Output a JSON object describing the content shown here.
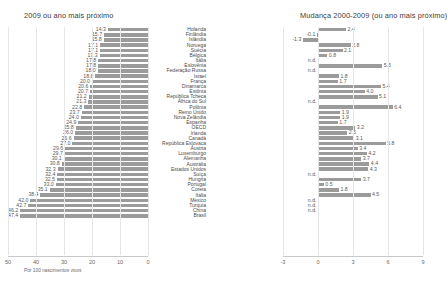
{
  "panels": {
    "left": {
      "title": "2009 ou ano mais próximo",
      "axis_note": "Por 100 nascimentos vivos"
    },
    "right": {
      "title": "Mudança 2000-2009 (ou ano mais próximo)"
    }
  },
  "chart_data": [
    {
      "type": "bar",
      "title": "2009 ou ano mais próximo",
      "orientation": "horizontal",
      "direction": "right-to-left",
      "xlabel": "Por 100 nascimentos vivos",
      "ylabel": "",
      "xlim": [
        50,
        0
      ],
      "ticks": [
        "50",
        "40",
        "30",
        "20",
        "10",
        "0"
      ],
      "grid": true,
      "categories": [
        "Holanda",
        "Finlândia",
        "Islândia",
        "Noruega",
        "Suécia",
        "Bélgica",
        "Itália",
        "Eslovênia",
        "Federação Russa",
        "Israel",
        "França",
        "Dinamarca",
        "Estônia",
        "República Tcheca",
        "África do Sul",
        "Polônia",
        "Reino Unido",
        "Nova Zelândia",
        "Espanha",
        "OECD",
        "Irlanda",
        "Canadá",
        "República Eslovaca",
        "Áustria",
        "Luxemburgo",
        "Alemanha",
        "Austrália",
        "Estados Unidos",
        "Suíça",
        "Hungria",
        "Portugal",
        "Coreia",
        "Itália",
        "México",
        "Turquia",
        "China",
        "Brasil"
      ],
      "values": [
        14.3,
        15.7,
        15.8,
        17.1,
        17.1,
        17.3,
        17.8,
        17.8,
        18.0,
        18.8,
        20.0,
        20.6,
        20.7,
        21.2,
        21.3,
        22.8,
        23.7,
        24.0,
        24.9,
        25.8,
        26.0,
        26.6,
        27.0,
        29.6,
        29.7,
        30.1,
        30.8,
        32.3,
        32.4,
        32.5,
        33.0,
        35.1,
        38.4,
        42.0,
        42.7,
        46.2,
        47.4
      ]
    },
    {
      "type": "bar",
      "title": "Mudança 2000-2009 (ou ano mais próximo)",
      "orientation": "horizontal",
      "direction": "left-to-right",
      "xlabel": "",
      "ylabel": "",
      "xlim": [
        -3,
        9
      ],
      "ticks": [
        "-3",
        "0",
        "3",
        "6",
        "9"
      ],
      "grid": true,
      "categories": [
        "Holanda",
        "Finlândia",
        "Islândia",
        "Noruega",
        "Suécia",
        "Bélgica",
        "Itália",
        "Eslovênia",
        "Federação Russa",
        "Israel",
        "França",
        "Dinamarca",
        "Estônia",
        "República Tcheca",
        "África do Sul",
        "Polônia",
        "Reino Unido",
        "Nova Zelândia",
        "Espanha",
        "OECD",
        "Irlanda",
        "Canadá",
        "República Eslovaca",
        "Áustria",
        "Luxemburgo",
        "Alemanha",
        "Austrália",
        "Estados Unidos",
        "Suíça",
        "Hungria",
        "Portugal",
        "Coreia",
        "Itália",
        "México",
        "Turquia",
        "China",
        "Brasil"
      ],
      "values": [
        2.4,
        -0.1,
        -1.3,
        2.8,
        2.1,
        0.8,
        null,
        5.5,
        null,
        1.8,
        1.7,
        5.4,
        4.0,
        5.1,
        null,
        6.4,
        1.9,
        1.9,
        1.7,
        3.2,
        2.5,
        3.1,
        5.8,
        3.4,
        4.2,
        3.7,
        4.4,
        4.3,
        null,
        3.7,
        0.5,
        1.8,
        4.5,
        null,
        null,
        null,
        null
      ],
      "missing_label": "n.d."
    }
  ],
  "rows": [
    {
      "country": "Holanda",
      "left": "14.3",
      "right": "2.4"
    },
    {
      "country": "Finlândia",
      "left": "15.7",
      "right": "-0.1"
    },
    {
      "country": "Islândia",
      "left": "15.8",
      "right": "-1.3"
    },
    {
      "country": "Noruega",
      "left": "17.1",
      "right": "2.8"
    },
    {
      "country": "Suécia",
      "left": "17.1",
      "right": "2.1"
    },
    {
      "country": "Bélgica",
      "left": "17.3",
      "right": "0.8"
    },
    {
      "country": "Itália",
      "left": "17.8",
      "right": "n.d."
    },
    {
      "country": "Eslovênia",
      "left": "17.8",
      "right": "5.5"
    },
    {
      "country": "Federação Russa",
      "left": "18.0",
      "right": "n.d."
    },
    {
      "country": "Israel",
      "left": "18.8",
      "right": "1.8"
    },
    {
      "country": "França",
      "left": "20.0",
      "right": "1.7"
    },
    {
      "country": "Dinamarca",
      "left": "20.6",
      "right": "5.4"
    },
    {
      "country": "Estônia",
      "left": "20.7",
      "right": "4.0"
    },
    {
      "country": "República Tcheca",
      "left": "21.2",
      "right": "5.1"
    },
    {
      "country": "África do Sul",
      "left": "21.3",
      "right": "n.d."
    },
    {
      "country": "Polônia",
      "left": "22.8",
      "right": "6.4"
    },
    {
      "country": "Reino Unido",
      "left": "23.7",
      "right": "1.9"
    },
    {
      "country": "Nova Zelândia",
      "left": "24.0",
      "right": "1.9"
    },
    {
      "country": "Espanha",
      "left": "24.9",
      "right": "1.7"
    },
    {
      "country": "OECD",
      "left": "25.8",
      "right": "3.2"
    },
    {
      "country": "Irlanda",
      "left": "26.0",
      "right": "2.5"
    },
    {
      "country": "Canadá",
      "left": "26.6",
      "right": "3.1"
    },
    {
      "country": "República Eslovaca",
      "left": "27.0",
      "right": "5.8"
    },
    {
      "country": "Áustria",
      "left": "29.6",
      "right": "3.4"
    },
    {
      "country": "Luxemburgo",
      "left": "29.7",
      "right": "4.2"
    },
    {
      "country": "Alemanha",
      "left": "30.1",
      "right": "3.7"
    },
    {
      "country": "Austrália",
      "left": "30.8",
      "right": "4.4"
    },
    {
      "country": "Estados Unidos",
      "left": "32.3",
      "right": "4.3"
    },
    {
      "country": "Suíça",
      "left": "32.4",
      "right": "n.d."
    },
    {
      "country": "Hungria",
      "left": "32.5",
      "right": "3.7"
    },
    {
      "country": "Portugal",
      "left": "33.0",
      "right": "0.5"
    },
    {
      "country": "Coreia",
      "left": "35.1",
      "right": "1.8"
    },
    {
      "country": "Itália",
      "left": "38.4",
      "right": "4.5"
    },
    {
      "country": "México",
      "left": "42.0",
      "right": "n.d."
    },
    {
      "country": "Turquia",
      "left": "42.7",
      "right": "n.d."
    },
    {
      "country": "China",
      "left": "46.2",
      "right": "n.d."
    },
    {
      "country": "Brasil",
      "left": "47.4",
      "right": ""
    }
  ],
  "axis_left_ticks": [
    "50",
    "40",
    "30",
    "20",
    "10",
    "0"
  ],
  "axis_right_ticks": [
    "-3",
    "0",
    "3",
    "6",
    "9"
  ]
}
